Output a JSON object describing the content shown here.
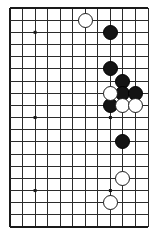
{
  "diagram": {
    "kind": "go-board-diagram",
    "board_size": 19,
    "colors": {
      "background": "#ffffff",
      "line": "#2b2b2b",
      "edge_line": "#1a1a1a",
      "black_stone": "#141414",
      "white_stone": "#ffffff",
      "white_stone_border": "#1a1a1a",
      "star_point": "#1a1a1a"
    },
    "geometry": {
      "left": 10,
      "top": 8,
      "right": 148,
      "bottom": 227,
      "cols": 12,
      "rows": 19,
      "col_spacing": 12.55,
      "row_spacing": 12.17,
      "stone_diameter": 15,
      "star_point_size": 3,
      "line_width": 1,
      "edge_line_width": 2.2
    },
    "star_points": [
      {
        "col": 2,
        "row": 2
      },
      {
        "col": 2,
        "row": 9
      },
      {
        "col": 2,
        "row": 15
      },
      {
        "col": 8,
        "row": 9
      },
      {
        "col": 8,
        "row": 15
      }
    ],
    "stones": [
      {
        "color": "white",
        "col": 6,
        "row": 1
      },
      {
        "color": "black",
        "col": 8,
        "row": 2
      },
      {
        "color": "black",
        "col": 8,
        "row": 5
      },
      {
        "color": "black",
        "col": 9,
        "row": 6
      },
      {
        "color": "white",
        "col": 8,
        "row": 7
      },
      {
        "color": "black",
        "col": 9,
        "row": 7
      },
      {
        "color": "black",
        "col": 10,
        "row": 7
      },
      {
        "color": "black",
        "col": 8,
        "row": 8
      },
      {
        "color": "white",
        "col": 9,
        "row": 8
      },
      {
        "color": "white",
        "col": 10,
        "row": 8
      },
      {
        "color": "black",
        "col": 9,
        "row": 11
      },
      {
        "color": "white",
        "col": 9,
        "row": 14
      },
      {
        "color": "white",
        "col": 8,
        "row": 16
      }
    ],
    "counts": {
      "black_stones": 7,
      "white_stones": 6,
      "total_stones": 13
    }
  }
}
